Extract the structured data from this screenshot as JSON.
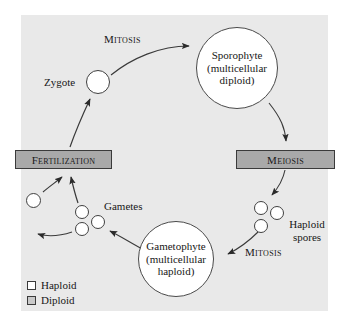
{
  "diagram": {
    "background_color": "#e9e9e9",
    "box_color": "#a9a9a9",
    "circle_fill": "#ffffff",
    "stroke_color": "#3a3a3a"
  },
  "processes": {
    "fertilization": "Fertilization",
    "meiosis": "Meiosis",
    "mitosis_top": "Mitosis",
    "mitosis_bottom": "Mitosis"
  },
  "structures": {
    "zygote": "Zygote",
    "sporophyte_line1": "Sporophyte",
    "sporophyte_line2": "(multicellular",
    "sporophyte_line3": "diploid)",
    "gametophyte_line1": "Gametophyte",
    "gametophyte_line2": "(multicellular",
    "gametophyte_line3": "haploid)",
    "gametes": "Gametes",
    "haploid_spores": "Haploid spores"
  },
  "legend": {
    "items": [
      {
        "label": "Haploid",
        "color": "#ffffff"
      },
      {
        "label": "Diploid",
        "color": "#c9c9c9"
      }
    ]
  }
}
